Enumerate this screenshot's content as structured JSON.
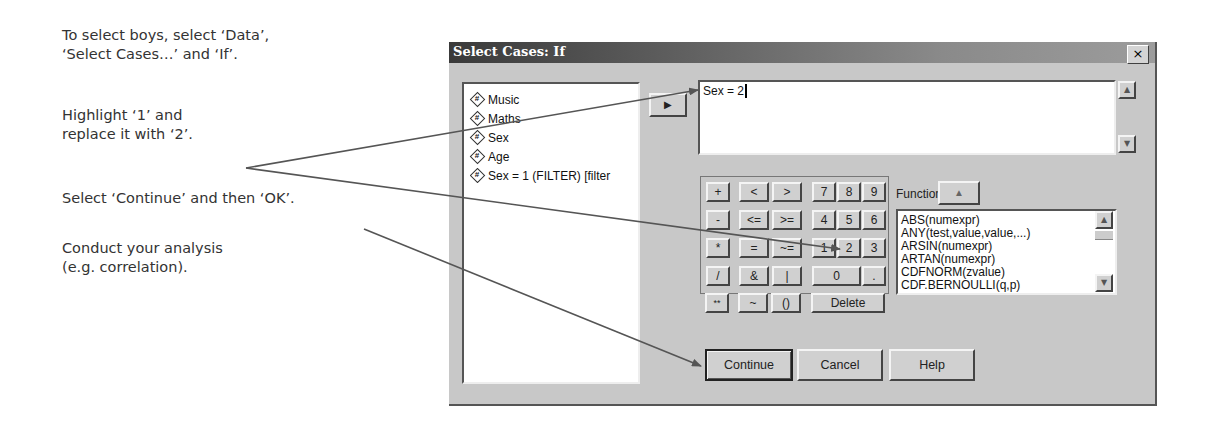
{
  "instructions": [
    {
      "line1": "To select boys, select ‘Data’,",
      "line2": "‘Select Cases…’ and ‘If’."
    },
    {
      "line1": "Highlight ‘1’ and",
      "line2": "replace it with ‘2’."
    },
    {
      "line1": "Select ‘Continue’ and then ‘OK’.",
      "line2": ""
    },
    {
      "line1": "Conduct your analysis",
      "line2": "(e.g. correlation)."
    }
  ],
  "dialog": {
    "title": "Select Cases: If",
    "close_label": "×",
    "variables": [
      {
        "label": "Music",
        "icon": "numeric-variable-icon"
      },
      {
        "label": "Maths",
        "icon": "numeric-variable-icon"
      },
      {
        "label": "Sex",
        "icon": "numeric-variable-icon"
      },
      {
        "label": "Age",
        "icon": "numeric-variable-icon"
      },
      {
        "label": "Sex = 1 (FILTER) [filter",
        "icon": "numeric-variable-icon"
      }
    ],
    "move_button_glyph": "▶",
    "expression": "Sex = 2",
    "keypad": {
      "keys": [
        "+",
        "<",
        ">",
        "7",
        "8",
        "9",
        "-",
        "<=",
        ">=",
        "4",
        "5",
        "6",
        "*",
        "=",
        "~=",
        "1",
        "2",
        "3",
        "/",
        "&",
        "|",
        "0",
        ".",
        "**",
        "~",
        "()",
        "Delete"
      ]
    },
    "functions_label": "Functions:",
    "functions_up_glyph": "▲",
    "functions": [
      "ABS(numexpr)",
      "ANY(test,value,value,...)",
      "ARSIN(numexpr)",
      "ARTAN(numexpr)",
      "CDFNORM(zvalue)",
      "CDF.BERNOULLI(q,p)"
    ],
    "buttons": {
      "continue": "Continue",
      "cancel": "Cancel",
      "help": "Help"
    }
  },
  "colors": {
    "arrow": "#555555",
    "dialog_bg": "#c8c8c8",
    "titlebar": "#3a3a3a"
  }
}
